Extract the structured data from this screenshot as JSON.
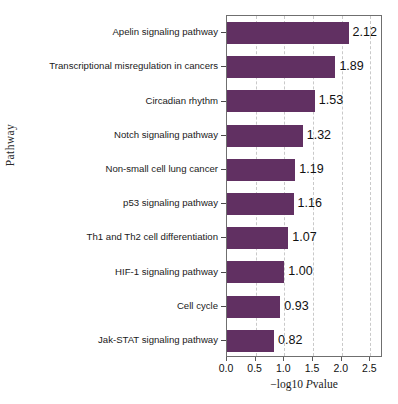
{
  "chart_data": {
    "type": "bar",
    "orientation": "horizontal",
    "title": "",
    "xlabel": "−log10 Pvalue",
    "ylabel": "Pathway",
    "xlim": [
      0.0,
      2.72
    ],
    "xticks": [
      0.0,
      0.5,
      1.0,
      1.5,
      2.0,
      2.5
    ],
    "xtick_labels": [
      "0.0",
      "0.5",
      "1.0",
      "1.5",
      "2.0",
      "2.5"
    ],
    "grid": "vertical-dashed",
    "legend": "none",
    "bar_color": "#613062",
    "categories": [
      "Apelin signaling pathway",
      "Transcriptional misregulation in cancers",
      "Circadian rhythm",
      "Notch signaling pathway",
      "Non-small cell lung cancer",
      "p53 signaling pathway",
      "Th1 and Th2 cell differentiation",
      "HIF-1 signaling pathway",
      "Cell cycle",
      "Jak-STAT signaling pathway"
    ],
    "values": [
      2.12,
      1.89,
      1.53,
      1.32,
      1.19,
      1.16,
      1.07,
      1.0,
      0.93,
      0.82
    ],
    "value_labels": [
      "2.12",
      "1.89",
      "1.53",
      "1.32",
      "1.19",
      "1.16",
      "1.07",
      "1.00",
      "0.93",
      "0.82"
    ]
  },
  "axis": {
    "x_title_prefix": "−log10 ",
    "x_title_italic": "P",
    "x_title_suffix": "value",
    "y_title": "Pathway"
  },
  "caption": ""
}
